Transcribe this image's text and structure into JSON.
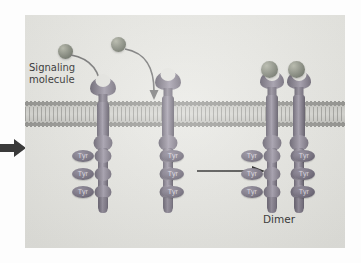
{
  "figure": {
    "type": "biological-diagram",
    "background_color": "#e6e6e1",
    "page_background": "#fdfdfd"
  },
  "labels": {
    "signaling_molecule_line1": "Signaling",
    "signaling_molecule_line2": "molecule",
    "dimer": "Dimer",
    "tyr": "Tyr"
  },
  "colors": {
    "receptor": "#7b7584",
    "receptor_dark": "#544f5c",
    "ligand_sphere": "#8e9285",
    "tyr_oval": "#6e6878",
    "tyr_text": "#d9d6de",
    "membrane_core": "#d6d6d1",
    "membrane_head": "#8e8e8a",
    "arrow_black": "#111111",
    "arrow_curved": "#6b6b6b",
    "label_text": "#2b2b2b"
  },
  "membrane": {
    "name": "plasma-membrane",
    "structure": "phospholipid bilayer",
    "top_y": 83,
    "height": 32
  },
  "ligands": [
    {
      "id": "ligand-1",
      "x": 33,
      "y": 29,
      "size": 15,
      "state": "free"
    },
    {
      "id": "ligand-2",
      "x": 86,
      "y": 22,
      "size": 15,
      "state": "free"
    },
    {
      "id": "ligand-3",
      "x": 227,
      "y": 58,
      "size": 15,
      "state": "bound"
    },
    {
      "id": "ligand-4",
      "x": 254,
      "y": 58,
      "size": 15,
      "state": "bound"
    }
  ],
  "binding_arrows": [
    {
      "id": "binding-arrow-1",
      "from_ligand": "ligand-1",
      "to": "receptor-1-binding-site"
    },
    {
      "id": "binding-arrow-2",
      "from_ligand": "ligand-2",
      "to": "receptor-2-binding-site"
    }
  ],
  "receptors": [
    {
      "id": "receptor-1",
      "state": "monomer",
      "x": 63,
      "tyr_side": "left",
      "tyr_count": 3,
      "tyr_labels": [
        "Tyr",
        "Tyr",
        "Tyr"
      ]
    },
    {
      "id": "receptor-2",
      "state": "monomer",
      "x": 128,
      "tyr_side": "right",
      "tyr_count": 3,
      "tyr_labels": [
        "Tyr",
        "Tyr",
        "Tyr"
      ]
    },
    {
      "id": "receptor-3",
      "state": "dimer-left",
      "x": 232,
      "tyr_side": "left",
      "tyr_count": 3,
      "tyr_labels": [
        "Tyr",
        "Tyr",
        "Tyr"
      ]
    },
    {
      "id": "receptor-4",
      "state": "dimer-right",
      "x": 259,
      "tyr_side": "right",
      "tyr_count": 3,
      "tyr_labels": [
        "Tyr",
        "Tyr",
        "Tyr"
      ]
    }
  ],
  "transition_arrow": {
    "id": "transition-arrow",
    "direction": "right",
    "x1": 172,
    "x2": 238,
    "y": 157
  },
  "entry_arrow": {
    "id": "entry-arrow",
    "direction": "right",
    "x": 0,
    "y": 138
  }
}
